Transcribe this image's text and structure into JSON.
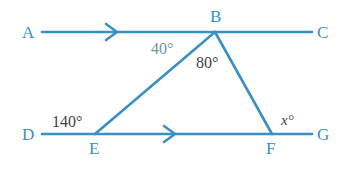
{
  "figure": {
    "type": "geometry-diagram",
    "background_color": "#ffffff",
    "line_color": "#3a8fc4",
    "label_color": "#3a8fc4",
    "angle_text_color": "#3f3f3f",
    "muted_angle_text_color": "#6f93ab"
  },
  "points": {
    "A": {
      "label": "A",
      "x": 27,
      "y": 33
    },
    "B": {
      "label": "B",
      "x": 215,
      "y": 17
    },
    "C": {
      "label": "C",
      "x": 322,
      "y": 33
    },
    "D": {
      "label": "D",
      "x": 27,
      "y": 134
    },
    "E": {
      "label": "E",
      "x": 95,
      "y": 149
    },
    "F": {
      "label": "F",
      "x": 272,
      "y": 149
    },
    "G": {
      "label": "G",
      "x": 322,
      "y": 134
    }
  },
  "segments": [
    {
      "name": "line-AC",
      "from": "A",
      "to": "C",
      "x1": 42,
      "y1": 32,
      "x2": 312,
      "y2": 32,
      "arrow": true
    },
    {
      "name": "line-DG",
      "from": "D",
      "to": "G",
      "x1": 42,
      "y1": 134,
      "x2": 312,
      "y2": 134,
      "arrow": true
    },
    {
      "name": "segment-EB",
      "from": "E",
      "to": "B",
      "x1": 95,
      "y1": 134,
      "x2": 215,
      "y2": 32,
      "arrow": false
    },
    {
      "name": "segment-BF",
      "from": "B",
      "to": "F",
      "x1": 215,
      "y1": 32,
      "x2": 272,
      "y2": 134,
      "arrow": false
    }
  ],
  "arrow_markers": [
    {
      "name": "arrow-marker-AC",
      "x": 114,
      "y": 32
    },
    {
      "name": "arrow-marker-DG",
      "x": 172,
      "y": 134
    }
  ],
  "angles": [
    {
      "name": "angle-ABE",
      "text": "40°",
      "x": 151,
      "y": 41,
      "style": "muted"
    },
    {
      "name": "angle-EBF",
      "text": "80°",
      "x": 196,
      "y": 55,
      "style": "normal"
    },
    {
      "name": "angle-DEB",
      "text": "140°",
      "x": 52,
      "y": 114,
      "style": "normal"
    },
    {
      "name": "angle-BFG",
      "text": "x°",
      "x": 281,
      "y": 113,
      "style": "italic-var"
    }
  ],
  "labels": {
    "A": "A",
    "B": "B",
    "C": "C",
    "D": "D",
    "E": "E",
    "F": "F",
    "G": "G"
  }
}
